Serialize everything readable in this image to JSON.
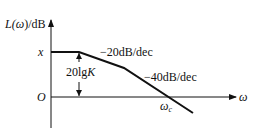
{
  "diagram": {
    "y_axis_label_prefix": "L(",
    "y_axis_label_omega": "ω",
    "y_axis_label_suffix": ")/dB",
    "x_axis_label": "ω",
    "origin_label": "O",
    "level_label": "x",
    "gain_label_prefix": "20lg",
    "gain_label_var": "K",
    "slope1_label": "−20dB/dec",
    "slope2_label": "−40dB/dec",
    "crossover_label": "ω",
    "crossover_sub": "c"
  }
}
